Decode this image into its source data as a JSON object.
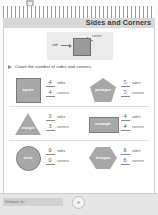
{
  "header": {
    "title": "Sides and Corners",
    "top_icon": "binding-clip-icon",
    "stripe_band": "striped-decoration"
  },
  "example": {
    "shape": "square",
    "side_label": "side",
    "corner_label": "corner"
  },
  "instruction": {
    "arrow": "triangle-right-icon",
    "text": "Count the number of sides and corners."
  },
  "shapes": [
    {
      "name": "square",
      "icon": "square-shape-icon",
      "sides_value": "4",
      "sides_label": "sides",
      "corners_value": "4",
      "corners_label": "corners"
    },
    {
      "name": "pentagon",
      "icon": "pentagon-shape-icon",
      "sides_value": "5",
      "sides_label": "sides",
      "corners_value": "5",
      "corners_label": "corners"
    },
    {
      "name": "triangle",
      "icon": "triangle-shape-icon",
      "sides_value": "3",
      "sides_label": "sides",
      "corners_value": "3",
      "corners_label": "corners"
    },
    {
      "name": "rectangle",
      "icon": "rectangle-shape-icon",
      "sides_value": "4",
      "sides_label": "sides",
      "corners_value": "4",
      "corners_label": "corners"
    },
    {
      "name": "circle",
      "icon": "circle-shape-icon",
      "sides_value": "0",
      "sides_label": "sides",
      "corners_value": "0",
      "corners_label": "corners"
    },
    {
      "name": "hexagon",
      "icon": "hexagon-shape-icon",
      "sides_value": "6",
      "sides_label": "sides",
      "corners_value": "6",
      "corners_label": "corners"
    }
  ],
  "footer": {
    "credit": "Scholastic Inc.",
    "page_number": "8"
  },
  "colors": {
    "shape_fill": "#a8a8a8",
    "shape_stroke": "#7b7b7b",
    "title_band": "#d8d8d8",
    "footer_band": "#e6e6e6"
  }
}
